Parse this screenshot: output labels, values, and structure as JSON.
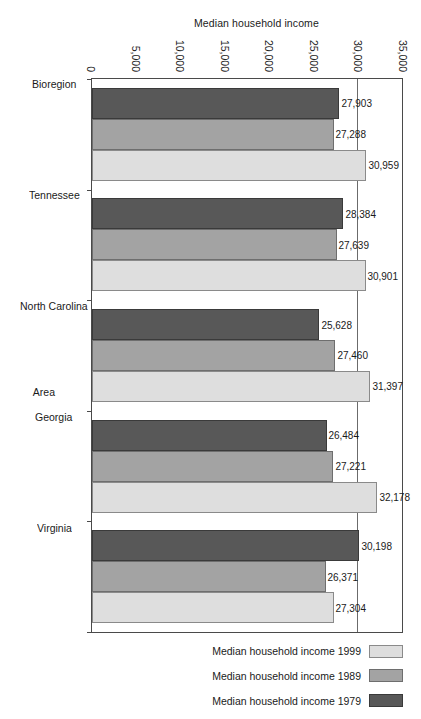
{
  "chart_data": {
    "type": "bar",
    "title": "",
    "xlabel": "Area",
    "ylabel": "Median household income",
    "ylim": [
      0,
      35000
    ],
    "yticks": [
      "0",
      "5,000",
      "10,000",
      "15,000",
      "20,000",
      "25,000",
      "30,000",
      "35,000"
    ],
    "ytick_values": [
      0,
      5000,
      10000,
      15000,
      20000,
      25000,
      30000,
      35000
    ],
    "grid": true,
    "legend_position": "right",
    "categories": [
      "Bioregion",
      "Tennessee",
      "North Carolina",
      "Georgia",
      "Virginia"
    ],
    "series": [
      {
        "name": "Median household income 1979",
        "color": "#585858",
        "values": [
          27903,
          28384,
          25628,
          26484,
          30198
        ],
        "labels": [
          "27,903",
          "28,384",
          "25,628",
          "26,484",
          "30,198"
        ]
      },
      {
        "name": "Median household income 1989",
        "color": "#a3a3a3",
        "values": [
          27288,
          27639,
          27460,
          27221,
          26371
        ],
        "labels": [
          "27,288",
          "27,639",
          "27,460",
          "27,221",
          "26,371"
        ]
      },
      {
        "name": "Median household income 1999",
        "color": "#dedede",
        "values": [
          30959,
          30901,
          31397,
          32178,
          27304
        ],
        "labels": [
          "30,959",
          "30,901",
          "31,397",
          "32,178",
          "27,304"
        ]
      }
    ]
  }
}
